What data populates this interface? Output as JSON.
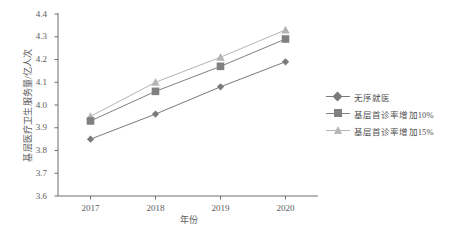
{
  "chart_data": {
    "type": "line",
    "title": "",
    "xlabel": "年份",
    "ylabel": "基层医疗卫生服务量/亿人次",
    "categories": [
      "2017",
      "2018",
      "2019",
      "2020"
    ],
    "x": [
      2017,
      2018,
      2019,
      2020
    ],
    "ylim": [
      3.6,
      4.4
    ],
    "y_ticks": [
      "3.6",
      "3.7",
      "3.8",
      "3.9",
      "4.0",
      "4.1",
      "4.2",
      "4.3",
      "4.4"
    ],
    "y_tick_values": [
      3.6,
      3.7,
      3.8,
      3.9,
      4.0,
      4.1,
      4.2,
      4.3,
      4.4
    ],
    "grid": false,
    "legend_position": "right",
    "series": [
      {
        "name": "无序就医",
        "marker": "diamond",
        "color": "#7a7a7a",
        "values": [
          3.85,
          3.96,
          4.08,
          4.19
        ]
      },
      {
        "name": "基层首诊率增加10%",
        "marker": "square",
        "color": "#808080",
        "values": [
          3.93,
          4.06,
          4.17,
          4.29
        ]
      },
      {
        "name": "基层首诊率增加15%",
        "marker": "triangle",
        "color": "#b5b5b5",
        "values": [
          3.95,
          4.1,
          4.21,
          4.33
        ]
      }
    ]
  },
  "axes": {
    "y_title": "基层医疗卫生服务量/亿人次",
    "x_title": "年份"
  },
  "legend": {
    "items": [
      {
        "label": "无序就医"
      },
      {
        "label": "基层首诊率增加10%"
      },
      {
        "label": "基层首诊率增加15%"
      }
    ]
  },
  "ticks": {
    "y": [
      "4.4",
      "4.3",
      "4.2",
      "4.1",
      "4.0",
      "3.9",
      "3.8",
      "3.7",
      "3.6"
    ],
    "x": [
      "2017",
      "2018",
      "2019",
      "2020"
    ]
  },
  "colors": {
    "axis": "#6f6f6f",
    "text": "#555555",
    "series1": "#7a7a7a",
    "series2": "#808080",
    "series3": "#b5b5b5"
  }
}
